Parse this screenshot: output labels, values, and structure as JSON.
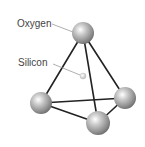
{
  "diagram": {
    "labels": {
      "oxygen": "Oxygen",
      "silicon": "Silicon"
    },
    "atoms": [
      {
        "id": "oxygen-top",
        "element": "Oxygen",
        "cx": 83,
        "cy": 33,
        "r": 11
      },
      {
        "id": "oxygen-left",
        "element": "Oxygen",
        "cx": 41,
        "cy": 103,
        "r": 11
      },
      {
        "id": "oxygen-right",
        "element": "Oxygen",
        "cx": 125,
        "cy": 98,
        "r": 11
      },
      {
        "id": "oxygen-bottom",
        "element": "Oxygen",
        "cx": 98,
        "cy": 123,
        "r": 12
      },
      {
        "id": "silicon-center",
        "element": "Silicon",
        "cx": 83,
        "cy": 76,
        "r": 3
      }
    ],
    "bonds": [
      [
        "oxygen-top",
        "oxygen-left"
      ],
      [
        "oxygen-top",
        "oxygen-bottom"
      ],
      [
        "oxygen-top",
        "oxygen-right"
      ],
      [
        "oxygen-left",
        "oxygen-right"
      ],
      [
        "oxygen-left",
        "oxygen-bottom"
      ],
      [
        "oxygen-bottom",
        "oxygen-right"
      ]
    ],
    "colors": {
      "bond": "#222222",
      "leader": "#999999",
      "label": "#444444",
      "sphere_light": "#ffffff",
      "sphere_mid": "#b5b5b5",
      "sphere_dark": "#6a6a6a"
    }
  }
}
